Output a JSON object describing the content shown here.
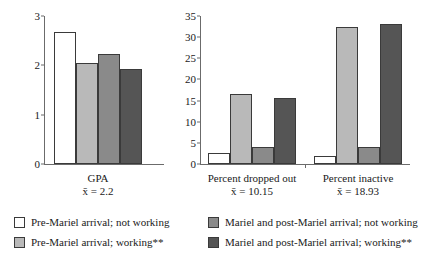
{
  "chart_data": {
    "type": "bar",
    "title": "",
    "subtitle": "",
    "panels": [
      {
        "id": "gpa",
        "xlabel_line1": "GPA",
        "xlabel_line2": "x̄ = 2.2",
        "ylabel": "",
        "ylim": [
          0,
          3
        ],
        "yticks": [
          "0",
          "1",
          "2",
          "3"
        ],
        "ytick_values": [
          0,
          1,
          2,
          3
        ],
        "grid": false,
        "categories": [
          "GPA"
        ],
        "series_values": [
          2.67,
          2.05,
          2.23,
          1.92
        ]
      },
      {
        "id": "percent",
        "xlabel_line1": "",
        "xlabel_line2": "",
        "ylabel": "",
        "ylim": [
          0,
          35
        ],
        "yticks": [
          "0",
          "5",
          "10",
          "15",
          "20",
          "25",
          "30",
          "35"
        ],
        "ytick_values": [
          0,
          5,
          10,
          15,
          20,
          25,
          30,
          35
        ],
        "grid": false,
        "categories": [
          "Percent dropped out",
          "Percent inactive"
        ],
        "category_sublabels": [
          "x̄ = 10.15",
          "x̄ = 18.93"
        ],
        "groups": [
          {
            "label": "Percent dropped out",
            "sublabel": "x̄ = 10.15",
            "values": [
              2.5,
              16.5,
              4.0,
              15.5
            ]
          },
          {
            "label": "Percent inactive",
            "sublabel": "x̄ = 18.93",
            "values": [
              2.0,
              32.5,
              4.0,
              33.0
            ]
          }
        ]
      }
    ],
    "series": [
      {
        "name": "Pre-Mariel arrival; not working",
        "color": "#ffffff"
      },
      {
        "name": "Pre-Mariel arrival; working**",
        "color": "#b9b9b9"
      },
      {
        "name": "Mariel and post-Mariel arrival; not working",
        "color": "#8a8a8a"
      },
      {
        "name": "Mariel and post-Mariel arrival; working**",
        "color": "#555555"
      }
    ],
    "legend": {
      "position": "bottom",
      "entries": [
        {
          "label": "Pre-Mariel arrival; not working",
          "color": "#ffffff"
        },
        {
          "label": "Pre-Mariel arrival; working**",
          "color": "#b9b9b9"
        },
        {
          "label": "Mariel and post-Mariel arrival; not working",
          "color": "#8a8a8a"
        },
        {
          "label": "Mariel and post-Mariel arrival; working**",
          "color": "#555555"
        }
      ]
    },
    "colors": {
      "axis": "#6b6b6b",
      "text": "#1a1a1a",
      "bar_border": "#3a3a3a",
      "background": "#ffffff"
    }
  }
}
